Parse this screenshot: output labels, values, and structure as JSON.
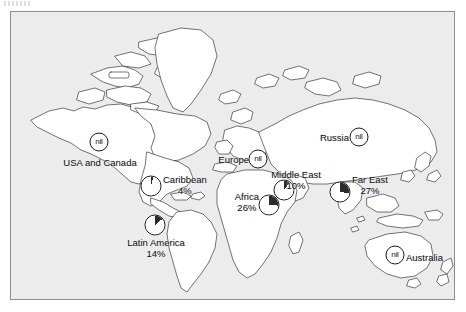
{
  "figure": {
    "type": "map",
    "title": "",
    "background_color": "#ececed",
    "frame_color": "#8d8d8f",
    "land_fill": "#ffffff",
    "outline_color": "#3a3a3a",
    "pie_fill": "#ffffff",
    "pie_slice_color": "#2b2b2b"
  },
  "chart_data": {
    "type": "pie",
    "categories": [
      "USA and Canada",
      "Caribbean",
      "Latin America",
      "Europe",
      "Africa",
      "Middle East",
      "Russia",
      "Far East",
      "Australia"
    ],
    "values": [
      0,
      4,
      14,
      0,
      26,
      10,
      0,
      27,
      0
    ],
    "value_labels": [
      "nil",
      "4%",
      "14%",
      "nil",
      "26%",
      "10%",
      "nil",
      "27%",
      "nil"
    ],
    "unit": "percent",
    "legend": "none",
    "grid": false
  },
  "regions": [
    {
      "id": "usa-and-canada",
      "name": "USA and Canada",
      "marker_type": "nil",
      "marker_text": "nil",
      "value_label": "",
      "label_align": "center",
      "marker": {
        "x": 88,
        "y": 130
      },
      "label": {
        "x": 89,
        "y": 150
      }
    },
    {
      "id": "caribbean",
      "name": "Caribbean",
      "marker_type": "pie",
      "marker_text": "",
      "value_label": "4%",
      "percent": 4,
      "label_align": "right",
      "marker": {
        "x": 140,
        "y": 174
      },
      "label": {
        "x": 152,
        "y": 173
      }
    },
    {
      "id": "latin-america",
      "name": "Latin America",
      "marker_type": "pie",
      "marker_text": "",
      "value_label": "14%",
      "percent": 14,
      "label_align": "center",
      "marker": {
        "x": 144,
        "y": 213
      },
      "label": {
        "x": 145,
        "y": 236
      }
    },
    {
      "id": "europe",
      "name": "Europe",
      "marker_type": "nil",
      "marker_text": "nil",
      "value_label": "",
      "label_align": "left",
      "marker": {
        "x": 247,
        "y": 147
      },
      "label": {
        "x": 238,
        "y": 147
      }
    },
    {
      "id": "africa",
      "name": "Africa",
      "marker_type": "pie",
      "marker_text": "",
      "value_label": "26%",
      "percent": 26,
      "label_align": "left",
      "marker": {
        "x": 258,
        "y": 193
      },
      "label": {
        "x": 248,
        "y": 190
      }
    },
    {
      "id": "middle-east",
      "name": "Middle East",
      "marker_type": "pie",
      "marker_text": "",
      "value_label": "10%",
      "percent": 10,
      "label_align": "center",
      "marker": {
        "x": 273,
        "y": 178
      },
      "label": {
        "x": 285,
        "y": 168
      }
    },
    {
      "id": "russia",
      "name": "Russia",
      "marker_type": "nil",
      "marker_text": "nil",
      "value_label": "",
      "label_align": "left",
      "marker": {
        "x": 348,
        "y": 125
      },
      "label": {
        "x": 338,
        "y": 125
      }
    },
    {
      "id": "far-east",
      "name": "Far East",
      "marker_type": "pie",
      "marker_text": "",
      "value_label": "27%",
      "percent": 27,
      "label_align": "right",
      "marker": {
        "x": 329,
        "y": 180
      },
      "label": {
        "x": 341,
        "y": 173
      }
    },
    {
      "id": "australia",
      "name": "Australia",
      "marker_type": "nil",
      "marker_text": "nil",
      "value_label": "",
      "label_align": "right",
      "marker": {
        "x": 384,
        "y": 243
      },
      "label": {
        "x": 395,
        "y": 245
      }
    }
  ]
}
